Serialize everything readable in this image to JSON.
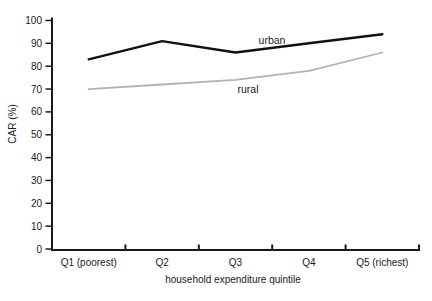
{
  "figure": {
    "background": "#ffffff",
    "axis_color": "#1a1a1a",
    "text_color": "#1a1a1a"
  },
  "chart_data": {
    "type": "line",
    "title": "",
    "xlabel": "household expenditure quintile",
    "ylabel": "CAR (%)",
    "categories": [
      "Q1 (poorest)",
      "Q2",
      "Q3",
      "Q4",
      "Q5 (richest)"
    ],
    "series": [
      {
        "name": "urban",
        "values": [
          83,
          91,
          86,
          90,
          94
        ],
        "color": "#111111",
        "stroke_width": 2.4
      },
      {
        "name": "rural",
        "values": [
          70,
          72,
          74,
          78,
          86
        ],
        "color": "#b3b3b3",
        "stroke_width": 1.8
      }
    ],
    "y_ticks": [
      0,
      10,
      20,
      30,
      40,
      50,
      60,
      70,
      80,
      90,
      100
    ],
    "ylim": [
      0,
      100
    ],
    "grid": false,
    "legend": "inline-labels"
  }
}
